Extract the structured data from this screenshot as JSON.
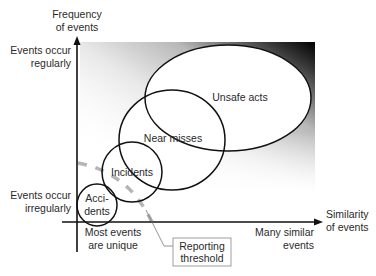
{
  "diagram": {
    "y_axis": {
      "title_line1": "Frequency",
      "title_line2": "of events",
      "high_label_line1": "Events occur",
      "high_label_line2": "regularly",
      "low_label_line1": "Events occur",
      "low_label_line2": "irregularly"
    },
    "x_axis": {
      "title_line1": "Similarity",
      "title_line2": "of events",
      "low_label_line1": "Most events",
      "low_label_line2": "are unique",
      "high_label_line1": "Many similar",
      "high_label_line2": "events"
    },
    "regions": [
      {
        "label": "Unsafe acts"
      },
      {
        "label": "Near misses"
      },
      {
        "label": "Incidents"
      },
      {
        "label_line1": "Acci-",
        "label_line2": "dents"
      }
    ],
    "threshold": {
      "label_line1": "Reporting",
      "label_line2": "threshold"
    },
    "colors": {
      "line": "#111111",
      "text": "#2a2a2a",
      "threshold_dash": "#b5b5b5",
      "gradient_dark": "#000000"
    }
  }
}
